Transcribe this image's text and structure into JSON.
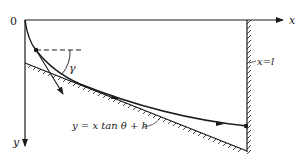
{
  "diagram": {
    "type": "physics-trajectory-sketch",
    "labels": {
      "origin": "0",
      "x_axis": "x",
      "y_axis": "y",
      "wall": "x=l",
      "angle": "γ",
      "ground_line": "y = x tan θ + h"
    },
    "elements": [
      "x-axis (horizontal, pointing right)",
      "y-axis (vertical, pointing down)",
      "vertical wall at x=l, hatched",
      "sloping ground line, hatched below",
      "trajectory curve from origin to wall",
      "dashed horizontal reference line at curve point",
      "velocity direction arrow at angle γ",
      "flow arrows along trajectory"
    ],
    "colors": {
      "stroke": "#1a1a1a",
      "background": "#ffffff"
    }
  }
}
